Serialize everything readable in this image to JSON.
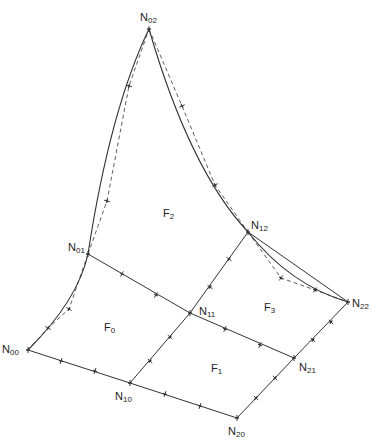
{
  "diagram": {
    "type": "quadrilateral mesh with curved boundary edges",
    "nodes": [
      {
        "id": "N00",
        "base": "N",
        "sub": "00",
        "x": 28,
        "y": 350,
        "label_x": 2,
        "label_y": 344
      },
      {
        "id": "N10",
        "base": "N",
        "sub": "10",
        "x": 130,
        "y": 383,
        "label_x": 115,
        "label_y": 391
      },
      {
        "id": "N20",
        "base": "N",
        "sub": "20",
        "x": 237,
        "y": 418,
        "label_x": 228,
        "label_y": 426
      },
      {
        "id": "N01",
        "base": "N",
        "sub": "01",
        "x": 88,
        "y": 254,
        "label_x": 68,
        "label_y": 242
      },
      {
        "id": "N11",
        "base": "N",
        "sub": "11",
        "x": 190,
        "y": 313,
        "label_x": 199,
        "label_y": 306
      },
      {
        "id": "N21",
        "base": "N",
        "sub": "21",
        "x": 294,
        "y": 358,
        "label_x": 299,
        "label_y": 362
      },
      {
        "id": "N02",
        "base": "N",
        "sub": "02",
        "x": 149,
        "y": 29,
        "label_x": 140,
        "label_y": 12
      },
      {
        "id": "N12",
        "base": "N",
        "sub": "12",
        "x": 248,
        "y": 232,
        "label_x": 251,
        "label_y": 220
      },
      {
        "id": "N22",
        "base": "N",
        "sub": "22",
        "x": 348,
        "y": 302,
        "label_x": 352,
        "label_y": 298
      }
    ],
    "faces": [
      {
        "id": "F0",
        "base": "F",
        "sub": "0",
        "x": 104,
        "y": 322
      },
      {
        "id": "F1",
        "base": "F",
        "sub": "1",
        "x": 211,
        "y": 363
      },
      {
        "id": "F2",
        "base": "F",
        "sub": "2",
        "x": 163,
        "y": 208
      },
      {
        "id": "F3",
        "base": "F",
        "sub": "3",
        "x": 264,
        "y": 302
      }
    ],
    "edges_straight": [
      {
        "from": "N00",
        "to": "N10",
        "ticks": [
          [
            61,
            361
          ],
          [
            95,
            371
          ]
        ]
      },
      {
        "from": "N10",
        "to": "N20",
        "ticks": [
          [
            165,
            394
          ],
          [
            200,
            406
          ]
        ]
      },
      {
        "from": "N01",
        "to": "N11",
        "ticks": [
          [
            122,
            274
          ],
          [
            156,
            295
          ]
        ]
      },
      {
        "from": "N11",
        "to": "N21",
        "ticks": [
          [
            225,
            329
          ],
          [
            260,
            345
          ]
        ]
      },
      {
        "from": "N12",
        "to": "N22",
        "ticks": []
      },
      {
        "from": "N10",
        "to": "N11",
        "ticks": [
          [
            150,
            361
          ],
          [
            170,
            337
          ]
        ]
      },
      {
        "from": "N20",
        "to": "N21",
        "ticks": [
          [
            256,
            398
          ],
          [
            275,
            378
          ]
        ]
      },
      {
        "from": "N11",
        "to": "N12",
        "ticks": [
          [
            210,
            287
          ],
          [
            229,
            259
          ]
        ]
      },
      {
        "from": "N21",
        "to": "N22",
        "ticks": [
          [
            313,
            340
          ],
          [
            331,
            322
          ]
        ]
      }
    ],
    "edges_curved": [
      {
        "from": "N00",
        "to": "N01",
        "path": "M28,350 Q78,300 88,254",
        "dashed_path": "M28,350 L48,328 L69,309 L88,254",
        "ticks": [
          [
            48,
            328
          ],
          [
            69,
            309
          ]
        ]
      },
      {
        "from": "N01",
        "to": "N02",
        "path": "M88,254 Q110,110 149,29",
        "dashed_path": "M88,254 L107,201 L129,86 L149,29",
        "ticks": [
          [
            107,
            201
          ],
          [
            129,
            86
          ]
        ]
      },
      {
        "from": "N02",
        "to": "N12",
        "path": "M149,29 Q190,170 248,232",
        "dashed_path": "M149,29 L182,106 L215,185 L248,232",
        "ticks": [
          [
            182,
            106
          ],
          [
            215,
            185
          ]
        ]
      },
      {
        "from": "N12",
        "to": "N22",
        "path": "M248,232 Q290,285 348,302",
        "dashed_path": "M248,232 L281,278 L315,290 L348,302",
        "ticks": [
          [
            281,
            278
          ],
          [
            315,
            290
          ]
        ]
      }
    ],
    "style": {
      "line_color": "#333333",
      "background": "#ffffff",
      "text_color": "#222222"
    }
  }
}
